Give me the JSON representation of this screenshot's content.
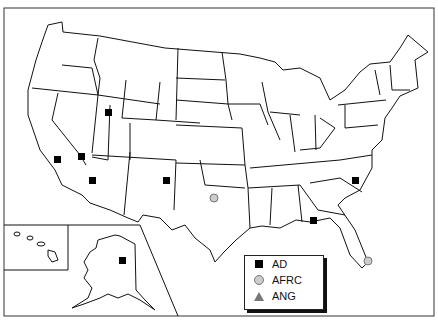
{
  "map": {
    "title": "U.S. base locations by component",
    "insets": [
      "Hawaii",
      "Alaska"
    ]
  },
  "legend": {
    "items": [
      {
        "symbol": "black-square",
        "label": "AD"
      },
      {
        "symbol": "gray-circle",
        "label": "AFRC"
      },
      {
        "symbol": "gray-triangle",
        "label": "ANG"
      }
    ]
  },
  "markers": [
    {
      "type": "AD",
      "location": "Utah"
    },
    {
      "type": "AD",
      "location": "Southern Nevada"
    },
    {
      "type": "AD",
      "location": "Central California"
    },
    {
      "type": "AD",
      "location": "Southern Arizona"
    },
    {
      "type": "AD",
      "location": "New Mexico"
    },
    {
      "type": "AD",
      "location": "South Carolina"
    },
    {
      "type": "AD",
      "location": "Florida Panhandle"
    },
    {
      "type": "AD",
      "location": "Alaska"
    },
    {
      "type": "AFRC",
      "location": "North Texas"
    },
    {
      "type": "AFRC",
      "location": "South Florida"
    }
  ],
  "colors": {
    "ad": "#000000",
    "afrc": "#cccccc",
    "ang": "#777777",
    "outline": "#111111"
  }
}
